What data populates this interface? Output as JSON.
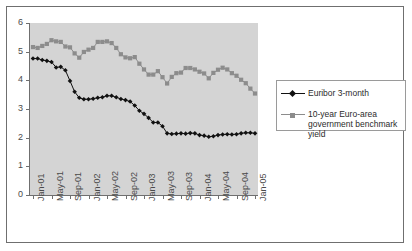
{
  "chart_data": {
    "type": "line",
    "title": "",
    "subtitle": "",
    "xlabel": "",
    "ylabel": "",
    "ylim": [
      0,
      6
    ],
    "yticks": [
      0,
      1,
      2,
      3,
      4,
      5,
      6
    ],
    "grid": false,
    "legend_position": "right",
    "x": [
      "Jan-01",
      "Feb-01",
      "Mar-01",
      "Apr-01",
      "May-01",
      "Jun-01",
      "Jul-01",
      "Aug-01",
      "Sep-01",
      "Oct-01",
      "Nov-01",
      "Dec-01",
      "Jan-02",
      "Feb-02",
      "Mar-02",
      "Apr-02",
      "May-02",
      "Jun-02",
      "Jul-02",
      "Aug-02",
      "Sep-02",
      "Oct-02",
      "Nov-02",
      "Dec-02",
      "Jan-03",
      "Feb-03",
      "Mar-03",
      "Apr-03",
      "May-03",
      "Jun-03",
      "Jul-03",
      "Aug-03",
      "Sep-03",
      "Oct-03",
      "Nov-03",
      "Dec-03",
      "Jan-04",
      "Feb-04",
      "Mar-04",
      "Apr-04",
      "May-04",
      "Jun-04",
      "Jul-04",
      "Aug-04",
      "Sep-04",
      "Oct-04",
      "Nov-04",
      "Dec-04",
      "Jan-05"
    ],
    "xtick_labels": [
      "Jan-01",
      "May-01",
      "Sep-01",
      "Jan-02",
      "May-02",
      "Sep-02",
      "Jan-03",
      "May-03",
      "Sep-03",
      "Jan-04",
      "May-04",
      "Sep-04",
      "Jan-05"
    ],
    "xtick_every": 4,
    "series": [
      {
        "name": "Euribor 3-month",
        "color": "#111111",
        "marker": "diamond",
        "values": [
          4.76,
          4.76,
          4.71,
          4.68,
          4.64,
          4.45,
          4.47,
          4.35,
          3.98,
          3.6,
          3.39,
          3.34,
          3.34,
          3.36,
          3.39,
          3.41,
          3.46,
          3.46,
          3.41,
          3.35,
          3.31,
          3.26,
          3.12,
          2.94,
          2.83,
          2.69,
          2.53,
          2.53,
          2.4,
          2.15,
          2.13,
          2.14,
          2.15,
          2.14,
          2.16,
          2.15,
          2.09,
          2.07,
          2.03,
          2.05,
          2.09,
          2.11,
          2.12,
          2.11,
          2.12,
          2.15,
          2.17,
          2.17,
          2.15
        ]
      },
      {
        "name": "10-year Euro-area government benchmark yield",
        "color": "#8c8c8c",
        "marker": "square",
        "values": [
          5.16,
          5.13,
          5.2,
          5.27,
          5.4,
          5.36,
          5.34,
          5.18,
          5.15,
          4.94,
          4.79,
          4.99,
          5.07,
          5.13,
          5.34,
          5.34,
          5.36,
          5.3,
          5.13,
          4.91,
          4.8,
          4.77,
          4.81,
          4.58,
          4.38,
          4.2,
          4.2,
          4.32,
          4.11,
          3.89,
          4.12,
          4.25,
          4.27,
          4.43,
          4.43,
          4.38,
          4.3,
          4.24,
          4.07,
          4.26,
          4.37,
          4.44,
          4.38,
          4.25,
          4.16,
          4.02,
          3.9,
          3.71,
          3.54
        ]
      }
    ]
  },
  "legend": {
    "items": [
      {
        "label": "Euribor 3-month"
      },
      {
        "label": "10-year Euro-area",
        "label2": "government benchmark yield"
      }
    ]
  }
}
